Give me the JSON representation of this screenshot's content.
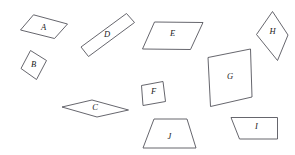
{
  "figure": {
    "background_color": "#ffffff",
    "stroke_color": "#55555c",
    "label_color": "#1a1a1a",
    "width": 295,
    "height": 155,
    "shape_count": 10
  },
  "shapes": [
    {
      "label": "A",
      "kind": "parallelogram",
      "points": "20.5,30.0 33.5,14.8 67.5,24.0 54.5,38.5",
      "label_x": 43.5,
      "label_y": 28.0
    },
    {
      "label": "B",
      "kind": "rhombus",
      "points": "30.5,50.5 46.5,60.5 36.5,79.5 21.0,68.5",
      "label_x": 33.5,
      "label_y": 65.5
    },
    {
      "label": "D",
      "kind": "thin-parallelogram",
      "points": "81.0,47.0 126.5,13.5 134.5,22.5 88.5,56.5",
      "label_x": 107.0,
      "label_y": 35.5
    },
    {
      "label": "E",
      "kind": "parallelogram",
      "points": "154.5,22.0 203.0,22.5 190.5,49.5 142.5,49.0",
      "label_x": 172.5,
      "label_y": 34.5
    },
    {
      "label": "H",
      "kind": "kite",
      "points": "272.5,11.5 288.0,35.0 277.5,60.5 256.5,34.5",
      "label_x": 272.5,
      "label_y": 32.0
    },
    {
      "label": "G",
      "kind": "square-rotated",
      "points": "208.0,57.5 250.5,49.0 252.0,97.0 210.5,106.5",
      "label_x": 230.0,
      "label_y": 77.5
    },
    {
      "label": "F",
      "kind": "square-rotated",
      "points": "141.5,85.5 163.0,81.5 165.5,101.5 143.0,105.5",
      "label_x": 153.5,
      "label_y": 92.5
    },
    {
      "label": "C",
      "kind": "rhombus-flat",
      "points": "62.0,107.0 92.0,100.0 128.5,110.0 97.0,117.0",
      "label_x": 95.0,
      "label_y": 108.5
    },
    {
      "label": "J",
      "kind": "trapezoid",
      "points": "154.0,119.0 187.0,119.0 196.0,148.0 143.0,148.0",
      "label_x": 169.5,
      "label_y": 137.0
    },
    {
      "label": "I",
      "kind": "trapezoid-right",
      "points": "231.0,117.5 277.5,117.5 277.5,139.0 239.5,139.0",
      "label_x": 256.5,
      "label_y": 127.5
    }
  ]
}
